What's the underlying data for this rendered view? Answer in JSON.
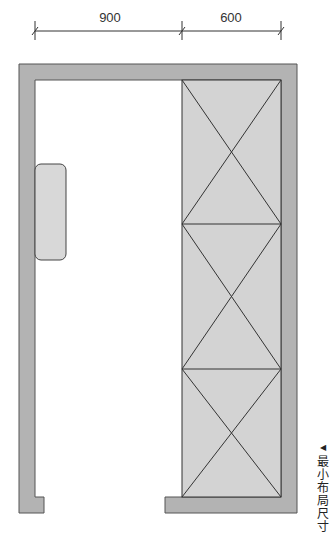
{
  "dimensions": {
    "left_width": "900",
    "right_width": "600"
  },
  "caption": {
    "marker": "◀",
    "text": "最小布局尺寸"
  },
  "colors": {
    "wall_fill": "#b3b3b3",
    "wall_stroke": "#555555",
    "cabinet_fill": "#d3d3d3",
    "fixture_fill": "#d8d8d8",
    "line": "#222222"
  },
  "layout": {
    "cabinet_sections": 3
  }
}
